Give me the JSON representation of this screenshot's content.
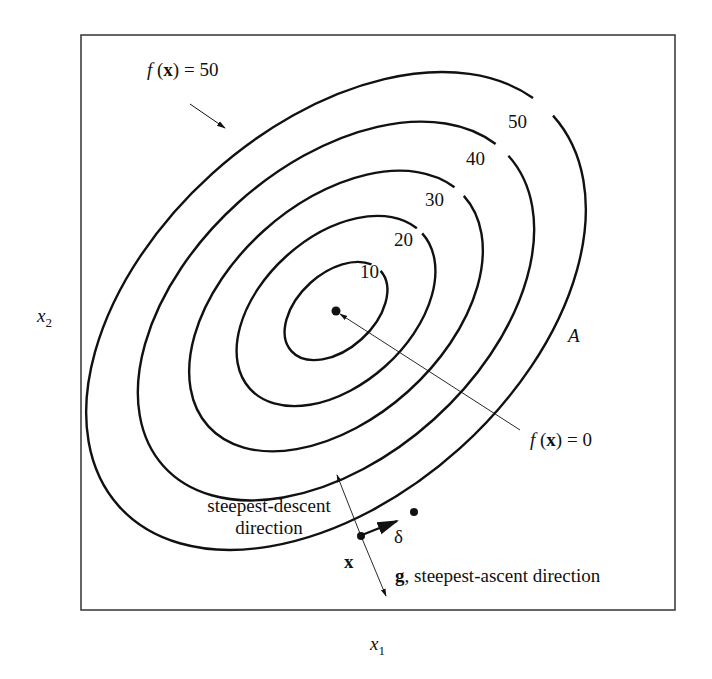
{
  "figure": {
    "axes": {
      "x_label": "x",
      "x_sub": "1",
      "y_label": "x",
      "y_sub": "2"
    },
    "contours": [
      {
        "level": "10",
        "label": "10"
      },
      {
        "level": "20",
        "label": "20"
      },
      {
        "level": "30",
        "label": "30"
      },
      {
        "level": "40",
        "label": "40"
      },
      {
        "level": "50",
        "label": "50"
      }
    ],
    "annotations": {
      "outer_contour": {
        "f": "f",
        "x": "x",
        "rest": ") = 50",
        "open": " ("
      },
      "minimum": {
        "f": "f",
        "x": "x",
        "rest": ") = 0",
        "open": " ("
      },
      "region_label": "A",
      "descent_line1": "steepest-descent",
      "descent_line2": "direction",
      "point_label": "x",
      "step_label": "δ",
      "gradient_bold": "g",
      "gradient_text": ", steepest-ascent direction"
    }
  }
}
